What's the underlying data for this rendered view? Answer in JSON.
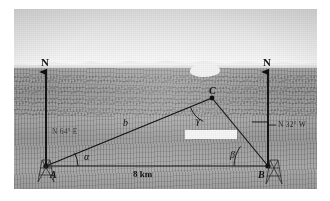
{
  "figure": {
    "kind": "surveying-triangle-over-photograph",
    "background_description": "grayscale desert landscape photograph with distant mountain ridge and hazy sky"
  },
  "points": {
    "a": {
      "label": "A",
      "x": 46,
      "y": 166
    },
    "b": {
      "label": "B",
      "x": 268,
      "y": 166
    },
    "c": {
      "label": "C",
      "x": 212,
      "y": 98
    }
  },
  "north_arrows": [
    {
      "label": "N",
      "side": "left",
      "x": 46,
      "y": 62
    },
    {
      "label": "N",
      "side": "right",
      "x": 268,
      "y": 62
    }
  ],
  "angles": {
    "alpha": {
      "symbol": "α",
      "vertex": "A"
    },
    "beta": {
      "symbol": "β",
      "vertex": "B"
    },
    "gamma": {
      "symbol": "γ",
      "vertex": "C"
    }
  },
  "sides": {
    "b": {
      "symbol": "b",
      "from": "A",
      "to": "C"
    },
    "base": {
      "length_label": "8 km",
      "from": "A",
      "to": "B"
    }
  },
  "bearings": {
    "from_a": "N 64° E",
    "from_b": "N 32° W"
  },
  "colors": {
    "line": "#101010",
    "photo_base": "#a9a9a9",
    "label_text": "#101010",
    "page_background": "#ffffff"
  }
}
